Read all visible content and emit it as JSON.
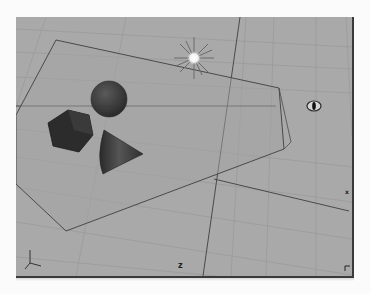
{
  "viewport": {
    "view": "perspective",
    "background_color": "#a9a9a9",
    "grid_color": "#989898",
    "axis_line_color": "#4a4a4a",
    "axis_labels": {
      "z": "z",
      "x": "x"
    },
    "corner_glyph": "⌐"
  },
  "scene": {
    "objects": [
      {
        "name": "ground-plane",
        "type": "plane-outline"
      },
      {
        "name": "sphere",
        "type": "sphere",
        "color": "#3e3e3e"
      },
      {
        "name": "cube",
        "type": "cube",
        "color": "#2e2e2e"
      },
      {
        "name": "cone",
        "type": "cone",
        "color": "#333333"
      },
      {
        "name": "point-light",
        "type": "light"
      },
      {
        "name": "camera-target",
        "type": "camera-icon"
      }
    ]
  }
}
